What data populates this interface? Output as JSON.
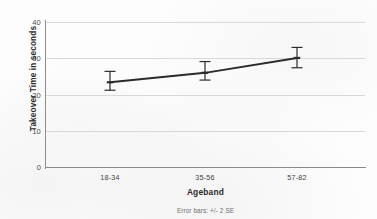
{
  "chart_data": {
    "type": "line",
    "title": "",
    "xlabel": "Ageband",
    "ylabel": "Takeover Time in seconds",
    "footnote": "Error bars: +/- 2 SE",
    "categories": [
      "18-34",
      "35-56",
      "57-82"
    ],
    "series": [
      {
        "name": "Mean takeover time",
        "values": [
          23.4,
          26.0,
          30.1
        ],
        "error_low": [
          21.2,
          24.0,
          27.4
        ],
        "error_high": [
          26.4,
          29.1,
          33.0
        ]
      }
    ],
    "ylim": [
      0,
      42
    ],
    "yticks": [
      0,
      10,
      20,
      30,
      40
    ],
    "ytick_labels": [
      "0",
      "10",
      "20",
      "30",
      "40"
    ],
    "grid": true,
    "grid_axis": "y",
    "legend": "none",
    "line_color": "#2b2b2b",
    "grid_color": "#d8d8d8",
    "axis_color": "#8a8a8a",
    "background": "#fdfdfd"
  }
}
